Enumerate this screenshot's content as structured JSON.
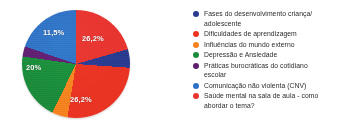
{
  "chart_data": {
    "type": "pie",
    "title": "",
    "legend_position": "right",
    "grid": false,
    "categories": [
      "Fases do desenvolvimento criança/ adolescente",
      "Dificuldades de aprendizagem",
      "Influências do mundo externo",
      "Depressão e Ansiedade",
      "Práticas burocráticas do cotidiano escolar",
      "Comunicação não violenta (CNV)",
      "Saúde mental na sala de aula - como abordar o tema?"
    ],
    "values": [
      5.5,
      26.2,
      4.6,
      20.0,
      3.1,
      11.5,
      26.2
    ],
    "value_labels": [
      "",
      "26,2%",
      "",
      "20%",
      "",
      "11,5%",
      "26,2%"
    ],
    "colors": [
      "#2a3b8f",
      "#ea3323",
      "#f5821f",
      "#1b8a3a",
      "#5e1f6e",
      "#2f6fc4",
      "#e8342f"
    ],
    "xlabel": "",
    "ylabel": ""
  },
  "slice_labels": {
    "upper_red": "26,2%",
    "lower_red": "26,2%",
    "green": "20%",
    "blue": "11,5%"
  },
  "legend": {
    "items": [
      {
        "label": "Fases do desenvolvimento criança/ adolescente",
        "color": "#2a3b8f"
      },
      {
        "label": "Dificuldades de aprendizagem",
        "color": "#ea3323"
      },
      {
        "label": "Influências do mundo externo",
        "color": "#f5821f"
      },
      {
        "label": "Depressão e Ansiedade",
        "color": "#1b8a3a"
      },
      {
        "label": "Práticas burocráticas do cotidiano escolar",
        "color": "#5e1f6e"
      },
      {
        "label": "Comunicação não violenta (CNV)",
        "color": "#2f6fc4"
      },
      {
        "label": "Saúde mental na sala de aula - como abordar o tema?",
        "color": "#e8342f"
      }
    ]
  }
}
